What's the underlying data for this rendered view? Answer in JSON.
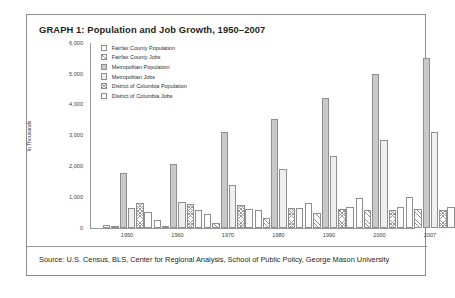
{
  "chart_data": {
    "type": "bar",
    "title": "GRAPH 1: Population and Job Growth, 1950–2007",
    "xlabel": "",
    "ylabel": "In Thousands",
    "ylim": [
      0,
      6000
    ],
    "yticks": [
      "0",
      "1,000",
      "2,000",
      "3,000",
      "4,000",
      "5,000",
      "6,000"
    ],
    "grid": false,
    "legend_position": "top-left",
    "categories": [
      "1950",
      "1960",
      "1970",
      "1980",
      "1990",
      "2000",
      "2007"
    ],
    "series": [
      {
        "name": "Fairfax County Population",
        "pattern": "plain",
        "values": [
          100,
          270,
          455,
          600,
          820,
          970,
          1020
        ]
      },
      {
        "name": "Fairfax County Jobs",
        "pattern": "diag",
        "values": [
          25,
          60,
          150,
          310,
          490,
          590,
          630
        ]
      },
      {
        "name": "Metropolitan Population",
        "pattern": "solid",
        "values": [
          1800,
          2080,
          3100,
          3550,
          4220,
          5000,
          5500
        ]
      },
      {
        "name": "Metropolitan Jobs",
        "pattern": "light",
        "values": [
          640,
          830,
          1400,
          1900,
          2330,
          2850,
          3100
        ]
      },
      {
        "name": "District of Columbia Population",
        "pattern": "cross",
        "values": [
          800,
          765,
          755,
          640,
          610,
          575,
          590
        ]
      },
      {
        "name": "District of Columbia Jobs",
        "pattern": "empty",
        "values": [
          520,
          600,
          630,
          640,
          670,
          680,
          690
        ]
      }
    ]
  },
  "source": {
    "text": "Source: U.S. Census, BLS, Center for Regional Analysis, School of Public Policy, George Mason University"
  }
}
